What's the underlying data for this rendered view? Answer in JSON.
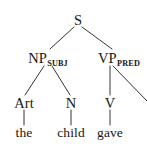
{
  "figure": {
    "type": "syntax-tree",
    "sentence": "the child gave",
    "background_color": "#ffffff",
    "line_color": "#1d1d1d",
    "text_color": "#161616"
  },
  "nodes": {
    "root": {
      "label": "S",
      "x": 78,
      "y": 20
    },
    "np": {
      "label": "NP",
      "subscript": "SUBJ",
      "x": 48,
      "y": 58
    },
    "vp": {
      "label": "VP",
      "subscript": "PRED",
      "x": 119,
      "y": 58
    },
    "art": {
      "label": "Art",
      "x": 24,
      "y": 103
    },
    "n": {
      "label": "N",
      "x": 71,
      "y": 103
    },
    "v": {
      "label": "V",
      "x": 110,
      "y": 103
    },
    "the": {
      "label": "the",
      "x": 24,
      "y": 133
    },
    "child": {
      "label": "child",
      "x": 71,
      "y": 133
    },
    "gave": {
      "label": "gave",
      "x": 110,
      "y": 133
    }
  },
  "edges": [
    {
      "name": "s-to-np",
      "x1": 74,
      "y1": 27,
      "x2": 50,
      "y2": 49
    },
    {
      "name": "s-to-vp",
      "x1": 82,
      "y1": 27,
      "x2": 112,
      "y2": 49
    },
    {
      "name": "np-to-art",
      "x1": 44,
      "y1": 66,
      "x2": 25,
      "y2": 95
    },
    {
      "name": "np-to-n",
      "x1": 52,
      "y1": 66,
      "x2": 70,
      "y2": 95
    },
    {
      "name": "vp-to-v",
      "x1": 110,
      "y1": 66,
      "x2": 110,
      "y2": 95
    },
    {
      "name": "vp-to-object",
      "x1": 113,
      "y1": 66,
      "x2": 147,
      "y2": 101
    },
    {
      "name": "art-to-the",
      "x1": 24,
      "y1": 110,
      "x2": 24,
      "y2": 125
    },
    {
      "name": "n-to-child",
      "x1": 71,
      "y1": 110,
      "x2": 71,
      "y2": 125
    },
    {
      "name": "v-to-gave",
      "x1": 110,
      "y1": 110,
      "x2": 110,
      "y2": 125
    }
  ]
}
